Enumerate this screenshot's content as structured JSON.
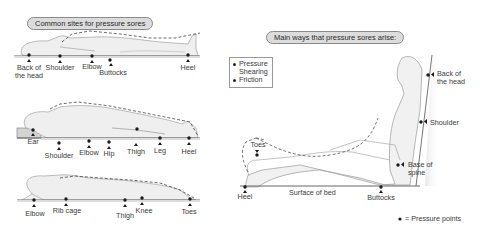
{
  "left_panel": {
    "title": "Common sites for pressure sores",
    "supine": {
      "labels": [
        "Back of the head",
        "Shoulder",
        "Elbow",
        "Buttocks",
        "Heel"
      ],
      "back_of_head_line1": "Back of",
      "back_of_head_line2": "the head",
      "shoulder": "Shoulder",
      "elbow": "Elbow",
      "buttocks": "Buttocks",
      "heel": "Heel"
    },
    "side_lying": {
      "labels": [
        "Ear",
        "Shoulder",
        "Elbow",
        "Hip",
        "Thigh",
        "Leg",
        "Heel"
      ],
      "ear": "Ear",
      "shoulder": "Shoulder",
      "elbow": "Elbow",
      "hip": "Hip",
      "thigh": "Thigh",
      "leg": "Leg",
      "heel": "Heel"
    },
    "prone": {
      "labels": [
        "Elbow",
        "Rib cage",
        "Thigh",
        "Knee",
        "Toes"
      ],
      "elbow": "Elbow",
      "rib_cage": "Rib cage",
      "thigh": "Thigh",
      "knee": "Knee",
      "toes": "Toes"
    }
  },
  "right_panel": {
    "title": "Main ways that pressure sores arise:",
    "causes_legend": {
      "items": [
        {
          "label": "Pressure",
          "bullet": true
        },
        {
          "label": "Shearing",
          "bullet": false
        },
        {
          "label": "Friction",
          "bullet": true
        }
      ]
    },
    "seated": {
      "toes": "Toes",
      "heel": "Heel",
      "surface_of_bed": "Surface of bed",
      "buttocks": "Buttocks",
      "back_of_head_line1": "Back of",
      "back_of_head_line2": "the head",
      "shoulder": "Shoulder",
      "base_of_spine_line1": "Base of",
      "base_of_spine_line2": "spine"
    },
    "key": {
      "icon": "pressure-point-dot",
      "label": "= Pressure points"
    }
  },
  "colors": {
    "body_fill": "#efefef",
    "body_stroke": "#9a9a9a",
    "bed_line": "#555555",
    "bed_shade": "#d9d9d9",
    "pressure_point": "#1a1a1a",
    "pill_fill": "#dcdcdc"
  }
}
